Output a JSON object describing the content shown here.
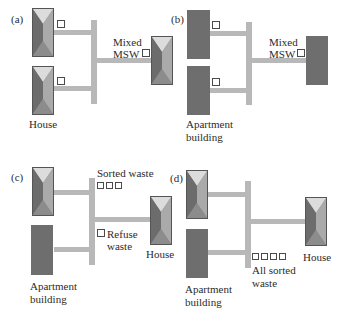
{
  "colors": {
    "pipe": "#b8b8b8",
    "apartment": "#6e6e6e",
    "house_roof_top": "#dcdcdc",
    "house_roof_left": "#6c6c6c",
    "house_roof_right": "#aaaaaa",
    "house_roof_bottom": "#8c8c8c",
    "bin_border": "#4a4a4a",
    "text": "#2b2b2b"
  },
  "panels": {
    "a": {
      "label": "(a)",
      "sources": [
        "house",
        "house"
      ],
      "source_label": "House",
      "collection_label_1": "Mixed",
      "collection_label_2": "MSW",
      "destination": "house"
    },
    "b": {
      "label": "(b)",
      "sources": [
        "apartment",
        "apartment"
      ],
      "source_label_1": "Apartment",
      "source_label_2": "building",
      "collection_label_1": "Mixed",
      "collection_label_2": "MSW",
      "destination": "apartment"
    },
    "c": {
      "label": "(c)",
      "sources": [
        "house",
        "apartment"
      ],
      "source_label_1": "Apartment",
      "source_label_2": "building",
      "sorted_label": "Sorted waste",
      "sorted_bins": 3,
      "refuse_label_1": "Refuse",
      "refuse_label_2": "waste",
      "destination": "house",
      "destination_label": "House"
    },
    "d": {
      "label": "(d)",
      "sources": [
        "house",
        "apartment"
      ],
      "source_label_1": "Apartment",
      "source_label_2": "building",
      "sorted_label_1": "All sorted",
      "sorted_label_2": "waste",
      "sorted_bins": 4,
      "destination": "house",
      "destination_label": "House"
    }
  }
}
